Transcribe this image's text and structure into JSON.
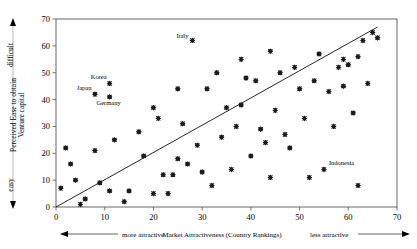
{
  "chart_data": {
    "type": "scatter",
    "title": "",
    "xlabel": "Market Attractiveness (Country Rankings)",
    "ylabel": "Perceived Ease to obtain Venture capital",
    "xlim": [
      0,
      70
    ],
    "ylim": [
      0,
      70
    ],
    "xticks": [
      0,
      10,
      20,
      30,
      40,
      50,
      60,
      70
    ],
    "yticks": [
      0,
      10,
      20,
      30,
      40,
      50,
      60,
      70
    ],
    "grid": false,
    "legend": false,
    "x_axis_left_note": "more attractive",
    "x_axis_right_note": "less attractive",
    "y_axis_top_note": "difficult",
    "y_axis_bottom_note": "easy",
    "trendline": {
      "x0": 0,
      "y0": 0,
      "x1": 66,
      "y1": 67
    },
    "points": [
      {
        "x": 1,
        "y": 7,
        "label": ""
      },
      {
        "x": 2,
        "y": 22,
        "label": ""
      },
      {
        "x": 3,
        "y": 16,
        "label": ""
      },
      {
        "x": 4,
        "y": 10,
        "label": ""
      },
      {
        "x": 5,
        "y": 1,
        "label": ""
      },
      {
        "x": 6,
        "y": 3,
        "label": ""
      },
      {
        "x": 8,
        "y": 42,
        "label": "Japan"
      },
      {
        "x": 8,
        "y": 21,
        "label": ""
      },
      {
        "x": 9,
        "y": 9,
        "label": ""
      },
      {
        "x": 11,
        "y": 46,
        "label": "Korea"
      },
      {
        "x": 11,
        "y": 6,
        "label": ""
      },
      {
        "x": 11,
        "y": 41,
        "label": "Germany"
      },
      {
        "x": 14,
        "y": 2,
        "label": ""
      },
      {
        "x": 15,
        "y": 6,
        "label": ""
      },
      {
        "x": 17,
        "y": 28,
        "label": ""
      },
      {
        "x": 18,
        "y": 19,
        "label": ""
      },
      {
        "x": 20,
        "y": 37,
        "label": ""
      },
      {
        "x": 21,
        "y": 33,
        "label": ""
      },
      {
        "x": 22,
        "y": 12,
        "label": ""
      },
      {
        "x": 23,
        "y": 5,
        "label": ""
      },
      {
        "x": 24,
        "y": 12,
        "label": ""
      },
      {
        "x": 25,
        "y": 44,
        "label": ""
      },
      {
        "x": 26,
        "y": 31,
        "label": ""
      },
      {
        "x": 27,
        "y": 16,
        "label": ""
      },
      {
        "x": 28,
        "y": 62,
        "label": "Italy"
      },
      {
        "x": 29,
        "y": 23,
        "label": ""
      },
      {
        "x": 30,
        "y": 13,
        "label": ""
      },
      {
        "x": 31,
        "y": 44,
        "label": ""
      },
      {
        "x": 33,
        "y": 50,
        "label": ""
      },
      {
        "x": 34,
        "y": 26,
        "label": ""
      },
      {
        "x": 35,
        "y": 37,
        "label": ""
      },
      {
        "x": 37,
        "y": 30,
        "label": ""
      },
      {
        "x": 38,
        "y": 55,
        "label": ""
      },
      {
        "x": 38,
        "y": 38,
        "label": ""
      },
      {
        "x": 39,
        "y": 48,
        "label": ""
      },
      {
        "x": 40,
        "y": 19,
        "label": ""
      },
      {
        "x": 41,
        "y": 47,
        "label": ""
      },
      {
        "x": 42,
        "y": 29,
        "label": ""
      },
      {
        "x": 43,
        "y": 24,
        "label": ""
      },
      {
        "x": 44,
        "y": 58,
        "label": ""
      },
      {
        "x": 44,
        "y": 11,
        "label": ""
      },
      {
        "x": 45,
        "y": 36,
        "label": ""
      },
      {
        "x": 46,
        "y": 50,
        "label": ""
      },
      {
        "x": 47,
        "y": 27,
        "label": ""
      },
      {
        "x": 48,
        "y": 22,
        "label": ""
      },
      {
        "x": 49,
        "y": 52,
        "label": ""
      },
      {
        "x": 50,
        "y": 44,
        "label": ""
      },
      {
        "x": 51,
        "y": 33,
        "label": ""
      },
      {
        "x": 52,
        "y": 11,
        "label": ""
      },
      {
        "x": 53,
        "y": 47,
        "label": ""
      },
      {
        "x": 54,
        "y": 57,
        "label": ""
      },
      {
        "x": 55,
        "y": 14,
        "label": "Indonesia"
      },
      {
        "x": 56,
        "y": 43,
        "label": ""
      },
      {
        "x": 57,
        "y": 30,
        "label": ""
      },
      {
        "x": 58,
        "y": 52,
        "label": ""
      },
      {
        "x": 59,
        "y": 45,
        "label": ""
      },
      {
        "x": 59,
        "y": 55,
        "label": ""
      },
      {
        "x": 60,
        "y": 53,
        "label": ""
      },
      {
        "x": 61,
        "y": 35,
        "label": ""
      },
      {
        "x": 62,
        "y": 56,
        "label": ""
      },
      {
        "x": 62,
        "y": 8,
        "label": ""
      },
      {
        "x": 63,
        "y": 62,
        "label": ""
      },
      {
        "x": 64,
        "y": 46,
        "label": ""
      },
      {
        "x": 65,
        "y": 65,
        "label": ""
      },
      {
        "x": 66,
        "y": 63,
        "label": ""
      },
      {
        "x": 25,
        "y": 18,
        "label": ""
      },
      {
        "x": 32,
        "y": 8,
        "label": ""
      },
      {
        "x": 36,
        "y": 14,
        "label": ""
      },
      {
        "x": 20,
        "y": 5,
        "label": ""
      },
      {
        "x": 12,
        "y": 25,
        "label": ""
      }
    ]
  },
  "colors": {
    "marker": "#1a1a1a",
    "frame": "#555555",
    "trend": "#000000",
    "background": "#ffffff"
  }
}
